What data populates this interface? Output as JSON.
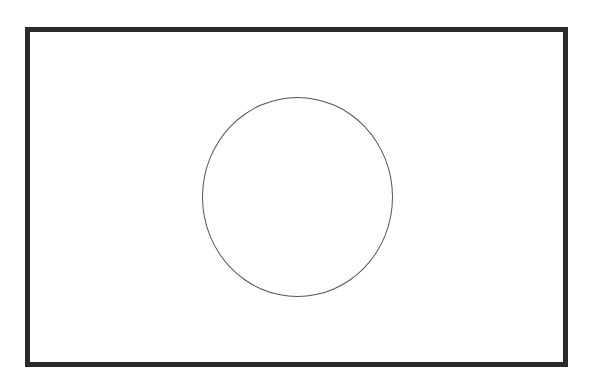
{
  "diagram": {
    "shapes": [
      {
        "type": "rectangle",
        "name": "outer-frame",
        "x": 25,
        "y": 27,
        "width": 543,
        "height": 340,
        "stroke": "#2a2a2a",
        "stroke_width": 5,
        "fill": "#ffffff"
      },
      {
        "type": "circle",
        "name": "center-circle",
        "cx": 297,
        "cy": 197,
        "rx": 95,
        "ry": 100,
        "stroke": "#555555",
        "stroke_width": 1.5,
        "fill": "none"
      }
    ],
    "colors": {
      "background": "#ffffff",
      "frame": "#2a2a2a",
      "circle": "#555555"
    }
  }
}
